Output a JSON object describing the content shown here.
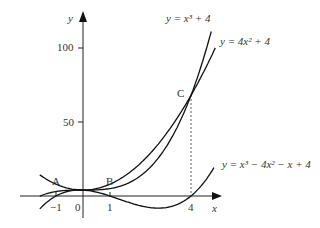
{
  "chart_data": {
    "type": "line",
    "title": "",
    "xlabel": "x",
    "ylabel": "y",
    "x_ticks": [
      "-1",
      "0",
      "1",
      "4"
    ],
    "y_ticks": [
      "50",
      "100"
    ],
    "xlim": [
      -1.6,
      4.9
    ],
    "ylim": [
      -15,
      120
    ],
    "grid": false,
    "series": [
      {
        "name": "y = x^3 + 4",
        "label": "y = x³ + 4",
        "expr": "cubic_plus4",
        "x_range": [
          -1.6,
          4.75
        ]
      },
      {
        "name": "y = 4x^2 + 4",
        "label": "y = 4x² + 4",
        "expr": "quad",
        "x_range": [
          -1.6,
          4.9
        ]
      },
      {
        "name": "y = x^3 - 4x^2 - x + 4",
        "label": "y = x³ − 4x² − x + 4",
        "expr": "cubic_diff",
        "x_range": [
          -1.6,
          4.85
        ]
      }
    ],
    "points": [
      {
        "name": "A",
        "x": -1
      },
      {
        "name": "B",
        "x": 1
      },
      {
        "name": "C",
        "x": 4,
        "y": 68
      }
    ],
    "annotations": [
      "dashed vertical line from C to x = 4"
    ]
  },
  "labels": {
    "y_axis": "y",
    "x_axis": "x",
    "tick_neg1": "−1",
    "tick_0": "0",
    "tick_1": "1",
    "tick_4": "4",
    "tick_50": "50",
    "tick_100": "100",
    "point_a": "A",
    "point_b": "B",
    "point_c": "C",
    "curve1": "y = x³ + 4",
    "curve2": "y = 4x² + 4",
    "curve3": "y = x³ − 4x² − x + 4"
  }
}
